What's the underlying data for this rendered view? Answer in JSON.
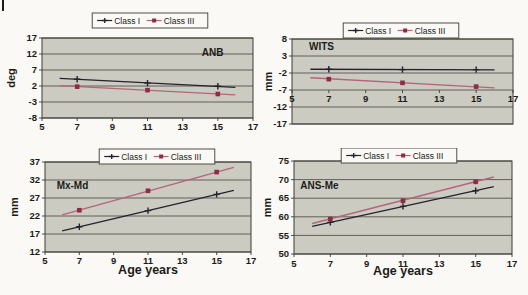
{
  "figure": {
    "legend_labels": [
      "Class I",
      "Class III"
    ]
  },
  "colors": {
    "page_bg": "#faf9f5",
    "plot_bg": "#cccbc1",
    "grid": "#55544e",
    "border": "#3c3c37",
    "text": "#1b1b19",
    "class1": "#23232f",
    "class3_line": "#b5647c",
    "class3_marker": "#8e2b45",
    "legend_bg": "#faf9f5"
  },
  "chart_data": [
    {
      "type": "line",
      "name": "ANB",
      "ylabel": "deg",
      "xlabel": null,
      "x_ticks": [
        5,
        7,
        9,
        11,
        13,
        15,
        17
      ],
      "y_ticks": [
        17,
        12,
        7,
        2,
        -3,
        -8
      ],
      "x_range": [
        5,
        17
      ],
      "y_range": [
        -8,
        17
      ],
      "x_labels_at": -8,
      "annotation": {
        "text": "ANB",
        "x": 14.7,
        "y": 11.5
      },
      "series": [
        {
          "name": "Class I",
          "marker": "plus",
          "x": [
            7,
            11,
            15
          ],
          "y": [
            4.1,
            2.9,
            1.9
          ],
          "trend_x": [
            6,
            16
          ],
          "trend_y": [
            4.4,
            1.6
          ]
        },
        {
          "name": "Class III",
          "marker": "square",
          "x": [
            7,
            11,
            15
          ],
          "y": [
            1.8,
            0.7,
            -0.5
          ],
          "trend_x": [
            6,
            16
          ],
          "trend_y": [
            2.1,
            -0.8
          ]
        }
      ]
    },
    {
      "type": "line",
      "name": "WITS",
      "ylabel": "mm",
      "xlabel": null,
      "x_ticks": [
        5,
        7,
        9,
        11,
        13,
        15,
        17
      ],
      "y_ticks": [
        8,
        3,
        -2,
        -7,
        -12,
        -17
      ],
      "x_range": [
        5,
        17
      ],
      "y_range": [
        -17,
        8
      ],
      "x_labels_at": -7,
      "annotation": {
        "text": "WITS",
        "x": 6.6,
        "y": 4.9
      },
      "series": [
        {
          "name": "Class I",
          "marker": "plus",
          "x": [
            7,
            11,
            15
          ],
          "y": [
            -0.9,
            -1.0,
            -1.0
          ],
          "trend_x": [
            6,
            16
          ],
          "trend_y": [
            -0.9,
            -1.1
          ]
        },
        {
          "name": "Class III",
          "marker": "square",
          "x": [
            7,
            11,
            15
          ],
          "y": [
            -3.8,
            -4.9,
            -6.0
          ],
          "trend_x": [
            6,
            16
          ],
          "trend_y": [
            -3.4,
            -6.4
          ]
        }
      ]
    },
    {
      "type": "line",
      "name": "Mx-Md",
      "ylabel": "mm",
      "xlabel": "Age years",
      "x_ticks": [
        5,
        7,
        9,
        11,
        13,
        15,
        17
      ],
      "y_ticks": [
        37,
        32,
        27,
        22,
        17,
        12
      ],
      "x_range": [
        5,
        17
      ],
      "y_range": [
        12,
        37
      ],
      "x_labels_at": 12,
      "annotation": {
        "text": "Mx-Md",
        "x": 6.6,
        "y": 29.6
      },
      "series": [
        {
          "name": "Class I",
          "marker": "plus",
          "x": [
            7,
            11,
            15
          ],
          "y": [
            19.0,
            23.5,
            28.0
          ],
          "trend_x": [
            6,
            16
          ],
          "trend_y": [
            17.9,
            29.1
          ]
        },
        {
          "name": "Class III",
          "marker": "square",
          "x": [
            7,
            11,
            15
          ],
          "y": [
            23.6,
            29.0,
            34.2
          ],
          "trend_x": [
            6,
            16
          ],
          "trend_y": [
            22.3,
            35.5
          ]
        }
      ]
    },
    {
      "type": "line",
      "name": "ANS-Me",
      "ylabel": "mm",
      "xlabel": "Age years",
      "x_ticks": [
        5,
        7,
        9,
        11,
        13,
        15,
        17
      ],
      "y_ticks": [
        75,
        70,
        65,
        60,
        55,
        50
      ],
      "x_range": [
        5,
        17
      ],
      "y_range": [
        50,
        75
      ],
      "x_labels_at": 50,
      "annotation": {
        "text": "ANS-Me",
        "x": 6.4,
        "y": 67.6
      },
      "series": [
        {
          "name": "Class I",
          "marker": "plus",
          "x": [
            7,
            11,
            15
          ],
          "y": [
            58.5,
            62.8,
            67.0
          ],
          "trend_x": [
            6,
            16
          ],
          "trend_y": [
            57.4,
            68.1
          ]
        },
        {
          "name": "Class III",
          "marker": "square",
          "x": [
            7,
            11,
            15
          ],
          "y": [
            59.4,
            64.3,
            69.4
          ],
          "trend_x": [
            6,
            16
          ],
          "trend_y": [
            58.2,
            70.7
          ]
        }
      ]
    }
  ]
}
